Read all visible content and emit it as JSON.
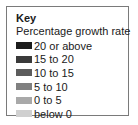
{
  "chart_data": {
    "type": "legend",
    "title": "Key",
    "subtitle": "Percentage growth rate",
    "entries": [
      {
        "label": "20 or above",
        "color": "#1c1c1c"
      },
      {
        "label": "15 to 20",
        "color": "#3a3a3a"
      },
      {
        "label": "10 to 15",
        "color": "#5c5c5c"
      },
      {
        "label": "5 to 10",
        "color": "#808080"
      },
      {
        "label": "0 to 5",
        "color": "#a9a9a9"
      },
      {
        "label": "below 0",
        "color": "#d0d0d0"
      }
    ]
  },
  "legend": {
    "title": "Key",
    "subtitle": "Percentage growth rate",
    "items": [
      {
        "label": "20 or above",
        "color": "#1c1c1c"
      },
      {
        "label": "15 to 20",
        "color": "#3a3a3a"
      },
      {
        "label": "10 to 15",
        "color": "#5c5c5c"
      },
      {
        "label": "5 to 10",
        "color": "#808080"
      },
      {
        "label": "0 to 5",
        "color": "#a9a9a9"
      },
      {
        "label": "below 0",
        "color": "#d0d0d0"
      }
    ]
  }
}
